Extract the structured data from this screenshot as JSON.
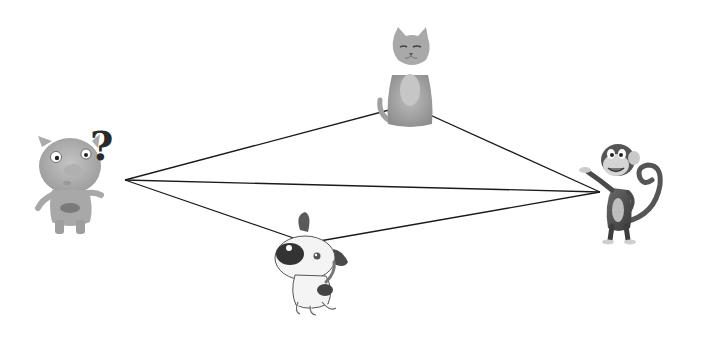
{
  "figure": {
    "characters": [
      {
        "name": "pig",
        "label": "pig with question mark",
        "anchor": [
          125,
          180
        ]
      },
      {
        "name": "cat",
        "label": "cat",
        "anchor": [
          408,
          105
        ]
      },
      {
        "name": "monkey",
        "label": "monkey",
        "anchor": [
          600,
          192
        ]
      },
      {
        "name": "dog",
        "label": "dog",
        "anchor": [
          308,
          243
        ]
      }
    ],
    "question_mark": "?",
    "segments": [
      {
        "from": "pig",
        "to": "cat"
      },
      {
        "from": "pig",
        "to": "monkey"
      },
      {
        "from": "pig",
        "to": "dog"
      },
      {
        "from": "cat",
        "to": "monkey"
      },
      {
        "from": "dog",
        "to": "monkey"
      }
    ],
    "line_color": "#1a1a1a"
  }
}
